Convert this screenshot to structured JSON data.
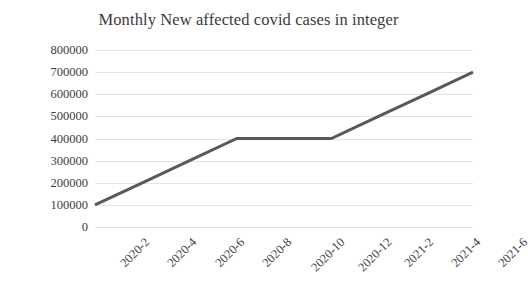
{
  "chart_data": {
    "type": "line",
    "title": "Monthly New affected covid cases in integer",
    "xlabel": "",
    "ylabel": "",
    "categories": [
      "2020-2",
      "2020-4",
      "2020-6",
      "2020-8",
      "2020-10",
      "2020-12",
      "2021-2",
      "2021-4",
      "2021-6"
    ],
    "values": [
      100000,
      200000,
      300000,
      400000,
      400000,
      400000,
      500000,
      600000,
      700000
    ],
    "series": [
      {
        "name": "Monthly New affected covid cases",
        "values": [
          100000,
          200000,
          300000,
          400000,
          400000,
          400000,
          500000,
          600000,
          700000
        ]
      }
    ],
    "ylim": [
      0,
      800000
    ],
    "yticks": [
      0,
      100000,
      200000,
      300000,
      400000,
      500000,
      600000,
      700000,
      800000
    ],
    "ytick_labels": [
      "0",
      "100000",
      "200000",
      "300000",
      "400000",
      "500000",
      "600000",
      "700000",
      "800000"
    ],
    "grid": true,
    "grid_axis": "y",
    "legend": false,
    "legend_position": "none",
    "line_color": "#595959",
    "line_width": 3,
    "markers": false,
    "background_color": "#ffffff",
    "grid_color": "#e4e4e6",
    "text_color": "#3d3d3d",
    "xtick_rotation": -45
  },
  "figure": {
    "title_text": "Monthly New affected covid cases in integer"
  }
}
